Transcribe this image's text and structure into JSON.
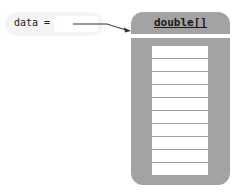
{
  "variable": {
    "name": "data",
    "operator": "=",
    "label": "data ="
  },
  "array": {
    "type_label": "double[]",
    "cell_count": 10,
    "cells": [
      "",
      "",
      "",
      "",
      "",
      "",
      "",
      "",
      "",
      ""
    ]
  },
  "colors": {
    "box_fill": "#a3a3a3",
    "cell_fill": "#ffffff",
    "pill_fill": "#f4f4f4",
    "arrow": "#333333"
  }
}
